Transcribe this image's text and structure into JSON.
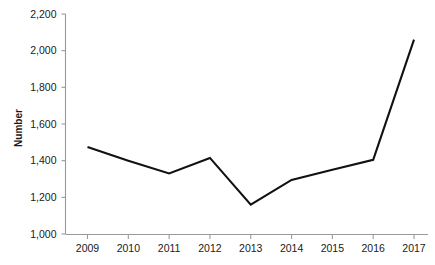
{
  "chart_data": {
    "type": "line",
    "title": "",
    "subtitle": "",
    "xlabel": "",
    "ylabel": "Number",
    "categories": [
      "2009",
      "2010",
      "2011",
      "2012",
      "2013",
      "2014",
      "2015",
      "2016",
      "2017"
    ],
    "x": [
      2009,
      2010,
      2011,
      2012,
      2013,
      2014,
      2015,
      2016,
      2017
    ],
    "values": [
      1475,
      1400,
      1330,
      1415,
      1160,
      1295,
      1350,
      1405,
      2060
    ],
    "series": [
      {
        "name": "Number",
        "values": [
          1475,
          1400,
          1330,
          1415,
          1160,
          1295,
          1350,
          1405,
          2060
        ],
        "color": "#111111"
      }
    ],
    "ylim": [
      1000,
      2200
    ],
    "yticks": [
      1000,
      1200,
      1400,
      1600,
      1800,
      2000,
      2200
    ],
    "ytick_labels": [
      "1,000",
      "1,200",
      "1,400",
      "1,600",
      "1,800",
      "2,000",
      "2,200"
    ],
    "xtick_labels": [
      "2009",
      "2010",
      "2011",
      "2012",
      "2013",
      "2014",
      "2015",
      "2016",
      "2017"
    ],
    "grid": false,
    "legend": false,
    "legend_position": "none",
    "markers": false,
    "line_color": "#111111",
    "axis_color": "#9a9a9a",
    "background_color": "#ffffff",
    "annotations": []
  }
}
